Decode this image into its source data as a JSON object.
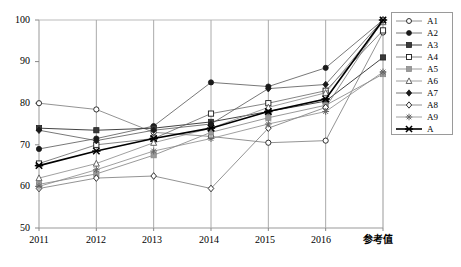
{
  "chart_data": {
    "type": "line",
    "title": "",
    "xlabel": "",
    "ylabel": "",
    "categories": [
      "2011",
      "2012",
      "2013",
      "2014",
      "2015",
      "2016",
      "参考值"
    ],
    "ylim": [
      50,
      100
    ],
    "yticks": [
      50,
      60,
      70,
      80,
      90,
      100
    ],
    "ytick_labels": [
      "50",
      "60",
      "70",
      "80",
      "90",
      "100"
    ],
    "grid": "vertical",
    "legend_position": "right",
    "series": [
      {
        "name": "A1",
        "marker": "open-circle",
        "values": [
          80.0,
          78.5,
          73.0,
          72.0,
          70.5,
          71.0,
          97.0
        ]
      },
      {
        "name": "A2",
        "marker": "filled-circle",
        "values": [
          69.0,
          71.5,
          74.5,
          85.0,
          84.0,
          88.5,
          100.0
        ]
      },
      {
        "name": "A3",
        "marker": "filled-square",
        "values": [
          74.0,
          73.5,
          74.0,
          75.5,
          78.0,
          80.5,
          91.0
        ]
      },
      {
        "name": "A4",
        "marker": "open-square",
        "values": [
          65.5,
          70.0,
          71.5,
          77.5,
          80.0,
          83.0,
          97.5
        ]
      },
      {
        "name": "A5",
        "marker": "filled-square-gray",
        "values": [
          60.5,
          63.0,
          67.5,
          73.0,
          76.5,
          79.5,
          87.0
        ]
      },
      {
        "name": "A6",
        "marker": "open-triangle",
        "values": [
          62.0,
          65.5,
          70.5,
          74.0,
          79.0,
          82.5,
          99.5
        ]
      },
      {
        "name": "A7",
        "marker": "filled-diamond",
        "values": [
          73.5,
          71.0,
          73.5,
          75.0,
          83.5,
          84.5,
          100.0
        ]
      },
      {
        "name": "A8",
        "marker": "open-diamond",
        "values": [
          59.5,
          62.0,
          62.5,
          59.5,
          74.0,
          79.0,
          100.0
        ]
      },
      {
        "name": "A9",
        "marker": "star",
        "values": [
          60.0,
          64.0,
          68.5,
          71.5,
          75.0,
          78.0,
          87.5
        ]
      },
      {
        "name": "A",
        "marker": "cross-bold",
        "values": [
          65.0,
          68.5,
          71.5,
          74.0,
          78.0,
          81.0,
          100.0
        ]
      }
    ]
  },
  "legend": {
    "items": [
      {
        "label": "A1"
      },
      {
        "label": "A2"
      },
      {
        "label": "A3"
      },
      {
        "label": "A4"
      },
      {
        "label": "A5"
      },
      {
        "label": "A6"
      },
      {
        "label": "A7"
      },
      {
        "label": "A8"
      },
      {
        "label": "A9"
      },
      {
        "label": "A"
      }
    ]
  },
  "axes": {
    "y_tick_0": "100",
    "y_tick_1": "90",
    "y_tick_2": "80",
    "y_tick_3": "70",
    "y_tick_4": "60",
    "y_tick_5": "50",
    "x_tick_0": "2011",
    "x_tick_1": "2012",
    "x_tick_2": "2013",
    "x_tick_3": "2014",
    "x_tick_4": "2015",
    "x_tick_5": "2016",
    "x_tick_6": "参考值"
  }
}
